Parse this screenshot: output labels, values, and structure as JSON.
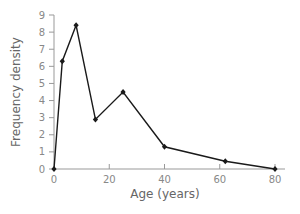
{
  "chart_data": {
    "type": "line",
    "title": "",
    "xlabel": "Age (years)",
    "ylabel": "Frequency density",
    "xlim": [
      0,
      80
    ],
    "ylim": [
      0,
      9
    ],
    "x_ticks": [
      0,
      20,
      40,
      60,
      80
    ],
    "y_ticks": [
      0,
      1,
      2,
      3,
      4,
      5,
      6,
      7,
      8,
      9
    ],
    "grid": false,
    "legend": null,
    "series": [
      {
        "name": "Frequency density",
        "x": [
          0,
          3,
          8,
          15,
          25,
          40,
          62,
          80
        ],
        "values": [
          0,
          6.3,
          8.4,
          2.9,
          4.5,
          1.3,
          0.45,
          0
        ]
      }
    ],
    "colors": {
      "line": "#1a1a1a",
      "axis": "#999999",
      "text": "#777777"
    }
  }
}
